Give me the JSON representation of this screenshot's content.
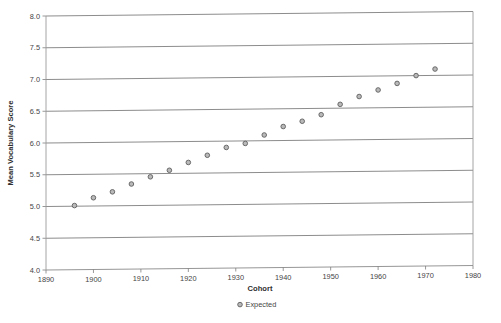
{
  "chart_data": {
    "type": "scatter",
    "title": "",
    "xlabel": "Cohort",
    "ylabel": "Mean Vocabulary Score",
    "xlim": [
      1890,
      1980
    ],
    "ylim": [
      4.0,
      8.0
    ],
    "xticks": [
      1890,
      1900,
      1910,
      1920,
      1930,
      1940,
      1950,
      1960,
      1970,
      1980
    ],
    "yticks": [
      4.0,
      4.5,
      5.0,
      5.5,
      6.0,
      6.5,
      7.0,
      7.5,
      8.0
    ],
    "xtick_labels": [
      "1890",
      "1900",
      "1910",
      "1920",
      "1930",
      "1940",
      "1950",
      "1960",
      "1970",
      "1980"
    ],
    "ytick_labels": [
      "4.0",
      "4.5",
      "5.0",
      "5.5",
      "6.0",
      "6.5",
      "7.0",
      "7.5",
      "8.0"
    ],
    "grid": "horizontal",
    "legend_position": "bottom",
    "marker_style": "open-circle",
    "marker_fill_color": "#b9b9b9",
    "marker_edge_color": "#5d5d5d",
    "grid_color": "#6e6e6e",
    "series": [
      {
        "name": "Expected",
        "x": [
          1896,
          1900,
          1904,
          1908,
          1912,
          1916,
          1920,
          1924,
          1928,
          1932,
          1936,
          1940,
          1944,
          1948,
          1952,
          1956,
          1960,
          1964,
          1968,
          1972
        ],
        "values": [
          5.01,
          5.13,
          5.22,
          5.34,
          5.45,
          5.55,
          5.67,
          5.78,
          5.9,
          5.96,
          6.09,
          6.22,
          6.3,
          6.4,
          6.56,
          6.68,
          6.78,
          6.88,
          7.0,
          7.1
        ]
      }
    ]
  },
  "legend": {
    "entries": [
      {
        "label": "Expected"
      }
    ]
  },
  "axes": {
    "x_title": "Cohort",
    "y_title": "Mean Vocabulary Score"
  }
}
